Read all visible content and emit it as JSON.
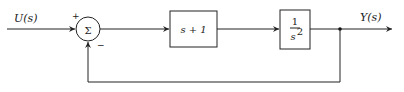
{
  "diagram": {
    "input": {
      "label": "U(s)"
    },
    "output": {
      "label": "Y(s)"
    },
    "summing_junction": {
      "symbol": "Σ",
      "plus_sign": "+",
      "minus_sign": "−"
    },
    "blocks": [
      {
        "id": "controller",
        "label": "s + 1"
      },
      {
        "id": "plant",
        "numerator": "1",
        "denominator": "s",
        "exponent": "2"
      }
    ],
    "feedback": {
      "type": "unity-negative"
    }
  }
}
